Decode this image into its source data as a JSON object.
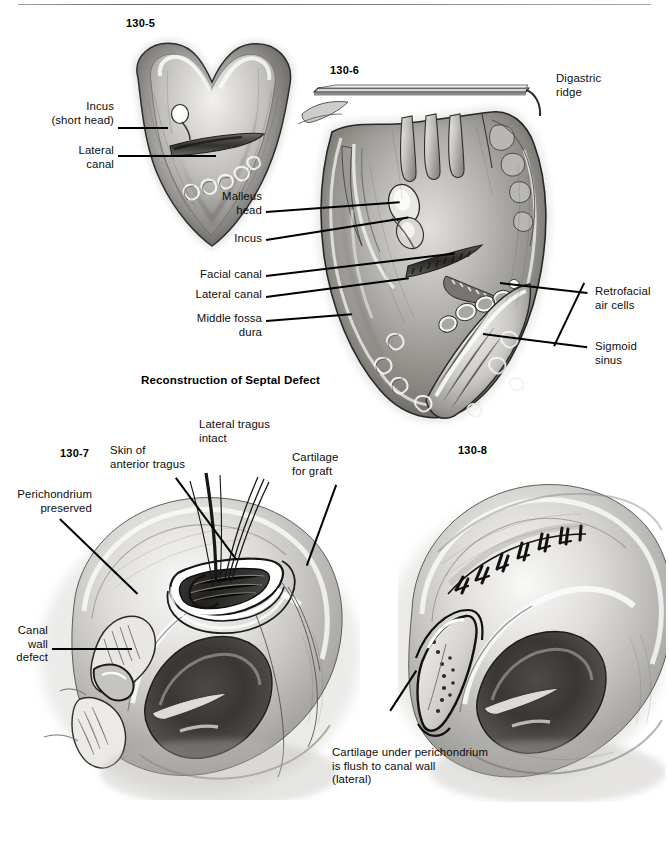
{
  "page": {
    "width": 669,
    "height": 845,
    "background": "#ffffff",
    "ink": "#000000",
    "rule_color": "#6a6a6a"
  },
  "section": {
    "title": "Reconstruction of Septal Defect"
  },
  "figures": [
    {
      "id": "fig-130-5",
      "number": "130-5",
      "caption": "Mastoid cavity view showing incus short head and lateral canal",
      "labels": [
        {
          "name": "incus-short-head",
          "text": "Incus\n(short head)"
        },
        {
          "name": "lateral-canal",
          "text": "Lateral\ncanal"
        }
      ]
    },
    {
      "id": "fig-130-6",
      "number": "130-6",
      "caption": "Wide mastoidectomy exposure with facial recess and sigmoid sinus",
      "labels": [
        {
          "name": "digastric-ridge",
          "text": "Digastric\nridge"
        },
        {
          "name": "malleus-head",
          "text": "Malleus\nhead"
        },
        {
          "name": "incus",
          "text": "Incus"
        },
        {
          "name": "facial-canal",
          "text": "Facial canal"
        },
        {
          "name": "lateral-canal",
          "text": "Lateral canal"
        },
        {
          "name": "middle-fossa-dura",
          "text": "Middle fossa\ndura"
        },
        {
          "name": "retrofacial-air-cells",
          "text": "Retrofacial\nair cells"
        },
        {
          "name": "sigmoid-sinus",
          "text": "Sigmoid\nsinus"
        }
      ]
    },
    {
      "id": "fig-130-7",
      "number": "130-7",
      "caption": "Harvest of tragal cartilage graft with perichondrium preserved",
      "labels": [
        {
          "name": "lateral-tragus-intact",
          "text": "Lateral tragus\nintact"
        },
        {
          "name": "skin-of-anterior-tragus",
          "text": "Skin of\nanterior tragus"
        },
        {
          "name": "cartilage-for-graft",
          "text": "Cartilage\nfor graft"
        },
        {
          "name": "perichondrium-preserved",
          "text": "Perichondrium\npreserved"
        },
        {
          "name": "canal-wall-defect",
          "text": "Canal\nwall\ndefect"
        }
      ]
    },
    {
      "id": "fig-130-8",
      "number": "130-8",
      "caption": "Closed tragal donor site with sutures and seated cartilage graft",
      "labels": [
        {
          "name": "cartilage-under-perichondrium",
          "text": "Cartilage under perichondrium\nis flush to canal wall\n(lateral)"
        }
      ]
    }
  ]
}
